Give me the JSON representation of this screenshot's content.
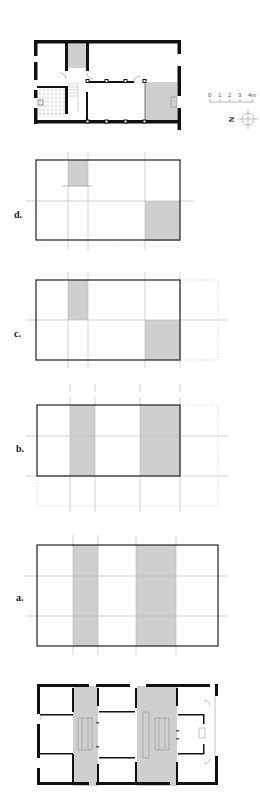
{
  "figure": {
    "colors": {
      "wall": "#111111",
      "shade": "#cfcfcf",
      "grid": "#b8b8b8",
      "outline": "#222222",
      "background": "#ffffff"
    }
  },
  "scale_bar": {
    "ticks": [
      "0",
      "1",
      "2",
      "3",
      "4m"
    ]
  },
  "north_arrow": {
    "letter": "N"
  },
  "diagrams": [
    {
      "id": "d",
      "label": "d.",
      "description": "small shaded bay upper-left, shaded quadrant lower-right"
    },
    {
      "id": "c",
      "label": "c.",
      "description": "shaded bay upper-left, shaded quadrant lower-right, dotted extension to the right"
    },
    {
      "id": "b",
      "label": "b.",
      "description": "two full-height shaded bands, dotted extension right and below"
    },
    {
      "id": "a",
      "label": "a.",
      "description": "two full-height shaded bands within enlarged rectangle"
    }
  ],
  "plans": [
    {
      "id": "existing-plan",
      "description": "original floor plan with shaded stair and room"
    },
    {
      "id": "final-plan",
      "description": "final floor plan with two shaded circulation bands"
    }
  ]
}
